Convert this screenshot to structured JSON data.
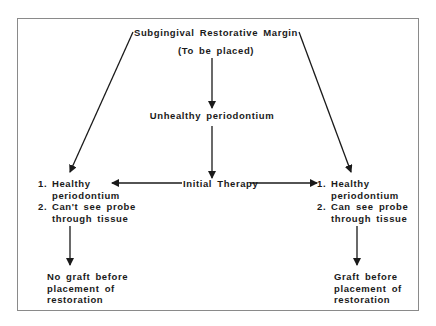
{
  "diagram": {
    "top": {
      "title": "Subgingival Restorative Margin",
      "subtitle": "(To be placed)"
    },
    "middle": {
      "state": "Unhealthy periodontium",
      "therapy": "Initial Therapy"
    },
    "left_branch": {
      "items": [
        {
          "num": "1.",
          "line1": "Healthy",
          "line2": "periodontium"
        },
        {
          "num": "2.",
          "line1": "Can't see probe",
          "line2": "through tissue"
        }
      ],
      "outcome": [
        "No graft before",
        "placement of",
        "restoration"
      ]
    },
    "right_branch": {
      "items": [
        {
          "num": "1.",
          "line1": "Healthy",
          "line2": "periodontium"
        },
        {
          "num": "2.",
          "line1": "Can see probe",
          "line2": "through tissue"
        }
      ],
      "outcome": [
        "Graft before",
        "placement of",
        "restoration"
      ]
    },
    "colors": {
      "line": "#1a1a1a",
      "frame": "#8a8a8a"
    }
  }
}
